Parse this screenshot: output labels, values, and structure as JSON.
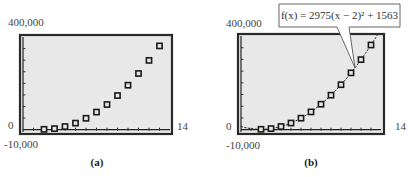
{
  "chart_data": [
    {
      "id": "a",
      "type": "scatter",
      "caption": "(a)",
      "x": [
        2,
        3,
        4,
        5,
        6,
        7,
        8,
        9,
        10,
        11,
        12,
        13
      ],
      "y": [
        1563,
        4538,
        13463,
        28338,
        49163,
        75938,
        108663,
        147338,
        191963,
        242538,
        299063,
        361538
      ],
      "xlim": [
        0,
        14
      ],
      "ylim": [
        -10000,
        400000
      ],
      "x_tick_step": 1,
      "y_tick_step": 50000,
      "labels": {
        "ymax": "400,000",
        "yzero": "0",
        "ymin": "-10,000",
        "xmax": "14"
      },
      "grid": false,
      "background": "#e8e8e8"
    },
    {
      "id": "b",
      "type": "scatter",
      "caption": "(b)",
      "x": [
        2,
        3,
        4,
        5,
        6,
        7,
        8,
        9,
        10,
        11,
        12,
        13
      ],
      "y": [
        1563,
        4538,
        13463,
        28338,
        49163,
        75938,
        108663,
        147338,
        191963,
        242538,
        299063,
        361538
      ],
      "xlim": [
        0,
        14
      ],
      "ylim": [
        -10000,
        400000
      ],
      "x_tick_step": 1,
      "y_tick_step": 50000,
      "labels": {
        "ymax": "400,000",
        "yzero": "0",
        "ymin": "-10,000",
        "xmax": "14"
      },
      "grid": false,
      "background": "#e8e8e8",
      "fit": {
        "a": 2975,
        "h": 2,
        "k": 1563,
        "label": "f(x) = 2975(x − 2)² + 1563"
      }
    }
  ]
}
